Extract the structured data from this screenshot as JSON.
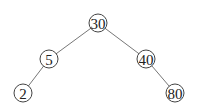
{
  "diagram": {
    "type": "binary-search-tree",
    "nodes": [
      {
        "id": "n30",
        "label": "30",
        "x": 98,
        "y": 23
      },
      {
        "id": "n5",
        "label": "5",
        "x": 49,
        "y": 59
      },
      {
        "id": "n40",
        "label": "40",
        "x": 146,
        "y": 59
      },
      {
        "id": "n2",
        "label": "2",
        "x": 23,
        "y": 93
      },
      {
        "id": "n80",
        "label": "80",
        "x": 175,
        "y": 93
      }
    ],
    "edges": [
      {
        "from": "n30",
        "to": "n5"
      },
      {
        "from": "n30",
        "to": "n40"
      },
      {
        "from": "n5",
        "to": "n2"
      },
      {
        "from": "n40",
        "to": "n80"
      }
    ],
    "node_radius": 9
  }
}
